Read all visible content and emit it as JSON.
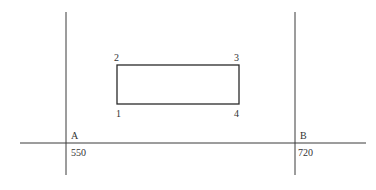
{
  "diagram": {
    "type": "site-plan-sketch",
    "stroke_color": "#3a3a3a",
    "background": "#ffffff",
    "axes": {
      "horizontal_line": {
        "y": 143,
        "x1": 20,
        "x2": 366
      },
      "vertical_lines": [
        {
          "id": "A",
          "x": 66,
          "y1": 12,
          "y2": 175,
          "label": "A",
          "value": "550"
        },
        {
          "id": "B",
          "x": 295,
          "y1": 12,
          "y2": 175,
          "label": "B",
          "value": "720"
        }
      ]
    },
    "rectangle": {
      "x": 117,
      "y": 65,
      "width": 122,
      "height": 39,
      "corners": [
        {
          "label": "1",
          "position": "bottom-left"
        },
        {
          "label": "2",
          "position": "top-left"
        },
        {
          "label": "3",
          "position": "top-right"
        },
        {
          "label": "4",
          "position": "bottom-right"
        }
      ]
    }
  }
}
